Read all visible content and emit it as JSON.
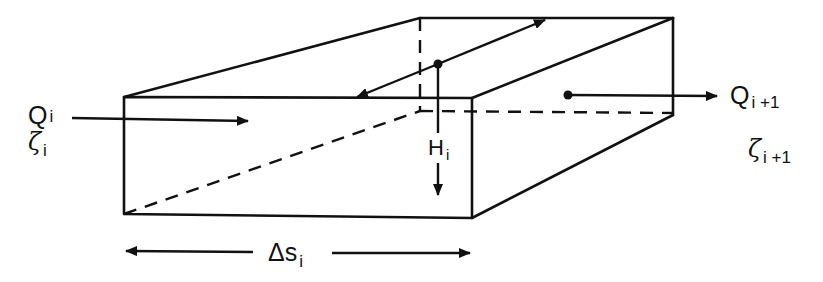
{
  "figure": {
    "type": "diagram",
    "colors": {
      "line": "#111111",
      "background": "#ffffff"
    }
  },
  "labels": {
    "inflow": {
      "symbol": "Q",
      "subscript": "i"
    },
    "inflow_stage": {
      "symbol": "ζ",
      "subscript": "i"
    },
    "outflow": {
      "symbol": "Q",
      "subscript": "i +1"
    },
    "outflow_stage": {
      "symbol": "ζ",
      "subscript": "i +1"
    },
    "depth": {
      "symbol": "H",
      "subscript": "i"
    },
    "length": {
      "symbol": "Δs",
      "subscript": "i"
    }
  }
}
